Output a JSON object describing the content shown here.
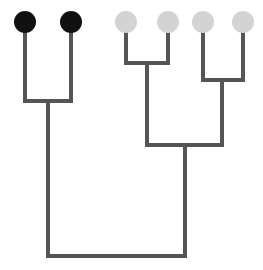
{
  "figure": {
    "name": "cladogram",
    "type": "phylogenetic-tree",
    "width": 263,
    "height": 270,
    "background_color": "#ffffff",
    "title": ""
  },
  "style": {
    "branch_color": "#555555",
    "branch_width": 4,
    "tip_radius": 11,
    "black_state_color": "#111111",
    "gray_state_color": "#d3d3d3"
  },
  "chart_data": {
    "type": "tree",
    "title": "",
    "xlabel": "",
    "ylabel": "",
    "legend": [],
    "tips": [
      {
        "id": "tip-1",
        "label": "",
        "x": 25,
        "y": 33,
        "state": "black",
        "color": "#111111"
      },
      {
        "id": "tip-2",
        "label": "",
        "x": 71,
        "y": 33,
        "state": "black",
        "color": "#111111"
      },
      {
        "id": "tip-3",
        "label": "",
        "x": 126,
        "y": 33,
        "state": "gray",
        "color": "#d3d3d3"
      },
      {
        "id": "tip-4",
        "label": "",
        "x": 168,
        "y": 33,
        "state": "gray",
        "color": "#d3d3d3"
      },
      {
        "id": "tip-5",
        "label": "",
        "x": 203,
        "y": 33,
        "state": "gray",
        "color": "#d3d3d3"
      },
      {
        "id": "tip-6",
        "label": "",
        "x": 243,
        "y": 33,
        "state": "gray",
        "color": "#d3d3d3"
      }
    ],
    "nodes": [
      {
        "id": "node-A",
        "label": "",
        "x": 48,
        "y": 101,
        "children": [
          "tip-1",
          "tip-2"
        ]
      },
      {
        "id": "node-B",
        "label": "",
        "x": 147,
        "y": 63,
        "children": [
          "tip-3",
          "tip-4"
        ]
      },
      {
        "id": "node-C",
        "label": "",
        "x": 222,
        "y": 80,
        "children": [
          "tip-5",
          "tip-6"
        ]
      },
      {
        "id": "node-BC",
        "label": "",
        "x": 185,
        "y": 145,
        "children": [
          "node-B",
          "node-C"
        ]
      },
      {
        "id": "node-root",
        "label": "",
        "x": 117,
        "y": 256,
        "children": [
          "node-A",
          "node-BC"
        ]
      }
    ],
    "branches": [
      {
        "id": "branch-tip-1",
        "x1": 25,
        "y1": 33,
        "x2": 25,
        "y2": 101
      },
      {
        "id": "branch-tip-2",
        "x1": 71,
        "y1": 33,
        "x2": 71,
        "y2": 101
      },
      {
        "id": "branch-node-A-bar",
        "x1": 25,
        "y1": 101,
        "x2": 71,
        "y2": 101
      },
      {
        "id": "branch-node-A-stem",
        "x1": 48,
        "y1": 101,
        "x2": 48,
        "y2": 256
      },
      {
        "id": "branch-tip-3",
        "x1": 126,
        "y1": 33,
        "x2": 126,
        "y2": 63
      },
      {
        "id": "branch-tip-4",
        "x1": 168,
        "y1": 33,
        "x2": 168,
        "y2": 63
      },
      {
        "id": "branch-node-B-bar",
        "x1": 126,
        "y1": 63,
        "x2": 168,
        "y2": 63
      },
      {
        "id": "branch-node-B-stem",
        "x1": 147,
        "y1": 63,
        "x2": 147,
        "y2": 145
      },
      {
        "id": "branch-tip-5",
        "x1": 203,
        "y1": 33,
        "x2": 203,
        "y2": 80
      },
      {
        "id": "branch-tip-6",
        "x1": 243,
        "y1": 33,
        "x2": 243,
        "y2": 80
      },
      {
        "id": "branch-node-C-bar",
        "x1": 203,
        "y1": 80,
        "x2": 243,
        "y2": 80
      },
      {
        "id": "branch-node-C-stem",
        "x1": 222,
        "y1": 80,
        "x2": 222,
        "y2": 145
      },
      {
        "id": "branch-node-BC-bar",
        "x1": 147,
        "y1": 145,
        "x2": 222,
        "y2": 145
      },
      {
        "id": "branch-node-BC-stem",
        "x1": 185,
        "y1": 145,
        "x2": 185,
        "y2": 256
      },
      {
        "id": "branch-root-bar",
        "x1": 48,
        "y1": 256,
        "x2": 185,
        "y2": 256
      }
    ]
  }
}
